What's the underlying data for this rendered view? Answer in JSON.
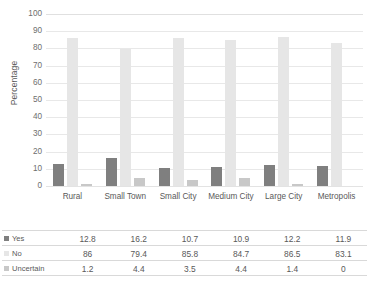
{
  "chart_data": {
    "type": "bar",
    "title": "",
    "subtitle": "",
    "xlabel": "",
    "ylabel": "Percentage",
    "ylim": [
      0,
      100
    ],
    "yticks": [
      100,
      90,
      80,
      70,
      60,
      50,
      40,
      30,
      20,
      10,
      0
    ],
    "grid": true,
    "legend_position": "table-row-headers",
    "categories": [
      "Rural",
      "Small Town",
      "Small City",
      "Medium City",
      "Large City",
      "Metropolis"
    ],
    "series": [
      {
        "name": "Yes",
        "color": "#7f7f7f",
        "values": [
          12.8,
          16.2,
          10.7,
          10.9,
          12.2,
          11.9
        ],
        "labels": [
          "12.8",
          "16.2",
          "10.7",
          "10.9",
          "12.2",
          "11.9"
        ]
      },
      {
        "name": "No",
        "color": "#e6e6e6",
        "values": [
          86,
          79.4,
          85.8,
          84.7,
          86.5,
          83.1
        ],
        "labels": [
          "86",
          "79.4",
          "85.8",
          "84.7",
          "86.5",
          "83.1"
        ]
      },
      {
        "name": "Uncertain",
        "color": "#c8c8c8",
        "values": [
          1.2,
          4.4,
          3.5,
          4.4,
          1.4,
          0
        ],
        "labels": [
          "1.2",
          "4.4",
          "3.5",
          "4.4",
          "1.4",
          "0"
        ]
      }
    ]
  },
  "colors": {
    "series_yes": "#7f7f7f",
    "series_no": "#e6e6e6",
    "series_uncertain": "#c8c8c8",
    "gridline": "#e8e8e8",
    "text": "#595959",
    "background": "#ffffff"
  }
}
